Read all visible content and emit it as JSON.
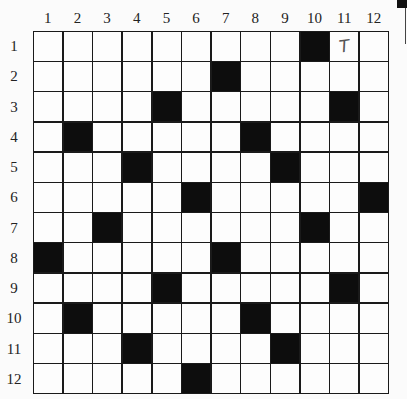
{
  "puzzle": {
    "rows": 12,
    "cols": 12,
    "column_labels": [
      "1",
      "2",
      "3",
      "4",
      "5",
      "6",
      "7",
      "8",
      "9",
      "10",
      "11",
      "12"
    ],
    "row_labels": [
      "1",
      "2",
      "3",
      "4",
      "5",
      "6",
      "7",
      "8",
      "9",
      "10",
      "11",
      "12"
    ],
    "black_cells": [
      [
        1,
        10
      ],
      [
        2,
        7
      ],
      [
        3,
        5
      ],
      [
        3,
        11
      ],
      [
        4,
        2
      ],
      [
        4,
        8
      ],
      [
        5,
        4
      ],
      [
        5,
        9
      ],
      [
        6,
        6
      ],
      [
        6,
        12
      ],
      [
        7,
        3
      ],
      [
        7,
        10
      ],
      [
        8,
        1
      ],
      [
        8,
        7
      ],
      [
        9,
        5
      ],
      [
        9,
        11
      ],
      [
        10,
        2
      ],
      [
        10,
        8
      ],
      [
        11,
        4
      ],
      [
        11,
        9
      ],
      [
        12,
        6
      ]
    ],
    "filled_letters": [
      {
        "row": 1,
        "col": 11,
        "letter": "T"
      }
    ]
  },
  "colors": {
    "black_cell": "#0d0d0d",
    "white_cell": "#fdfdfd",
    "grid_line": "#1a1a1a"
  }
}
